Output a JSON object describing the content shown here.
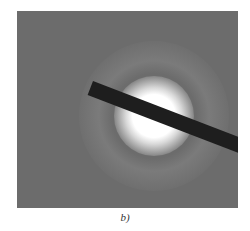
{
  "figure": {
    "caption": "b)",
    "colors": {
      "background": "#6c6c6c",
      "center": "#ffffff",
      "beam_stop": "#1e1e1e"
    }
  }
}
